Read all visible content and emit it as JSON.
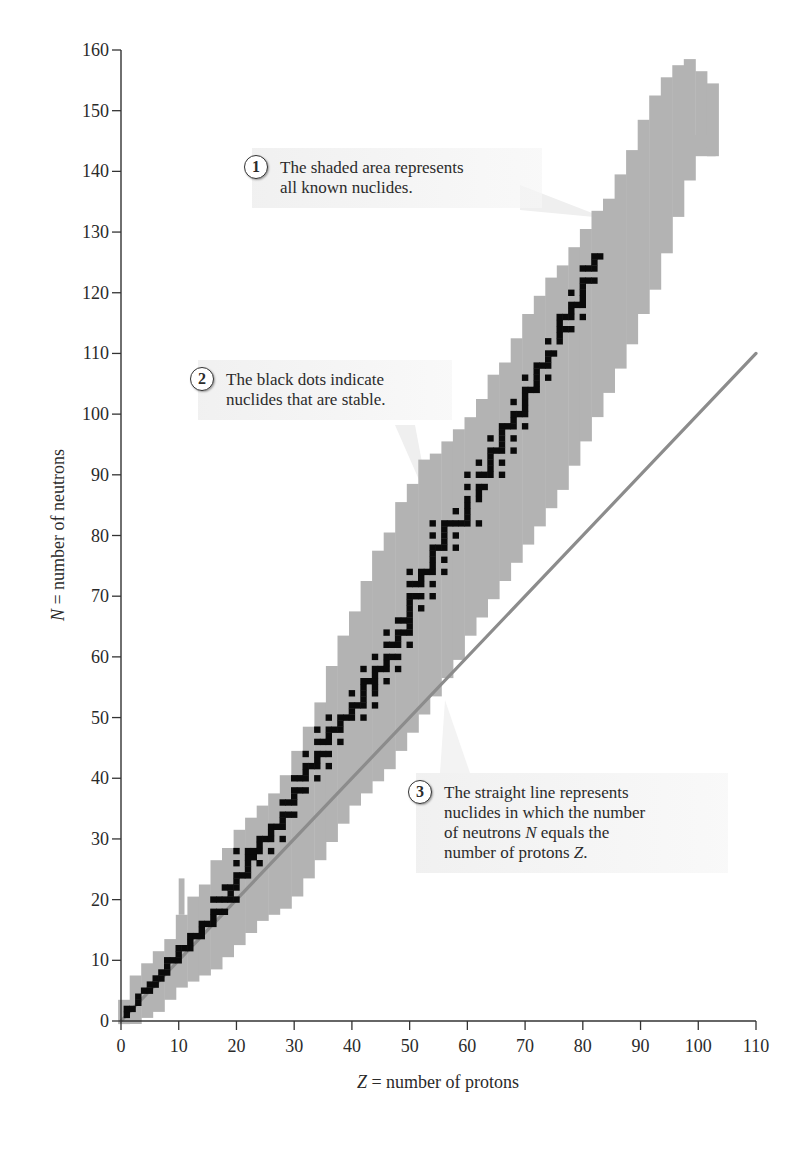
{
  "chart_data": {
    "type": "scatter",
    "xlabel_var": "Z",
    "xlabel_rest": " = number of protons",
    "ylabel_var": "N",
    "ylabel_rest": " = number of neutrons",
    "xlim": [
      0,
      110
    ],
    "ylim": [
      0,
      160
    ],
    "xticks": [
      0,
      10,
      20,
      30,
      40,
      50,
      60,
      70,
      80,
      90,
      100,
      110
    ],
    "yticks": [
      0,
      10,
      20,
      30,
      40,
      50,
      60,
      70,
      80,
      90,
      100,
      110,
      120,
      130,
      140,
      150,
      160
    ],
    "grid": false,
    "legend": "none (annotations used instead)",
    "series": [
      {
        "name": "Known nuclides (shaded area)",
        "kind": "band",
        "color": "#b3b3b3",
        "z": [
          0,
          2,
          4,
          6,
          8,
          10,
          12,
          14,
          16,
          18,
          20,
          22,
          24,
          26,
          28,
          30,
          32,
          34,
          36,
          38,
          40,
          42,
          44,
          46,
          48,
          50,
          52,
          54,
          56,
          58,
          60,
          62,
          64,
          66,
          68,
          70,
          72,
          74,
          76,
          78,
          80,
          82,
          84,
          86,
          88,
          90,
          92,
          94,
          96,
          98,
          100,
          102
        ],
        "n_min": [
          0,
          0,
          1,
          2,
          4,
          6,
          7,
          8,
          9,
          11,
          13,
          15,
          17,
          18,
          19,
          21,
          24,
          27,
          30,
          33,
          36,
          38,
          40,
          42,
          45,
          48,
          51,
          54,
          57,
          60,
          64,
          67,
          70,
          73,
          76,
          79,
          82,
          85,
          88,
          92,
          96,
          100,
          104,
          108,
          112,
          117,
          121,
          127,
          133,
          139,
          144,
          143
        ],
        "n_max": [
          3,
          7,
          9,
          11,
          13,
          17,
          20,
          22,
          26,
          28,
          31,
          33,
          35,
          37,
          40,
          44,
          48,
          52,
          58,
          63,
          67,
          72,
          77,
          80,
          85,
          88,
          92,
          93,
          95,
          97,
          99,
          102,
          106,
          108,
          112,
          116,
          119,
          122,
          124,
          127,
          130,
          133,
          135,
          139,
          143,
          148,
          152,
          155,
          157,
          158,
          156,
          154
        ]
      },
      {
        "name": "Stable nuclides (black dots)",
        "kind": "points",
        "color": "#0a0a0a",
        "points": [
          [
            1,
            1
          ],
          [
            1,
            2
          ],
          [
            2,
            2
          ],
          [
            3,
            3
          ],
          [
            3,
            4
          ],
          [
            4,
            5
          ],
          [
            5,
            5
          ],
          [
            5,
            6
          ],
          [
            6,
            6
          ],
          [
            6,
            7
          ],
          [
            7,
            7
          ],
          [
            7,
            8
          ],
          [
            8,
            8
          ],
          [
            8,
            9
          ],
          [
            8,
            10
          ],
          [
            9,
            10
          ],
          [
            10,
            10
          ],
          [
            10,
            11
          ],
          [
            10,
            12
          ],
          [
            11,
            12
          ],
          [
            12,
            12
          ],
          [
            12,
            13
          ],
          [
            12,
            14
          ],
          [
            13,
            14
          ],
          [
            14,
            14
          ],
          [
            14,
            15
          ],
          [
            14,
            16
          ],
          [
            15,
            16
          ],
          [
            16,
            16
          ],
          [
            16,
            17
          ],
          [
            16,
            18
          ],
          [
            16,
            20
          ],
          [
            17,
            18
          ],
          [
            17,
            20
          ],
          [
            18,
            18
          ],
          [
            18,
            20
          ],
          [
            18,
            22
          ],
          [
            19,
            20
          ],
          [
            19,
            21
          ],
          [
            19,
            22
          ],
          [
            20,
            20
          ],
          [
            20,
            22
          ],
          [
            20,
            23
          ],
          [
            20,
            24
          ],
          [
            20,
            26
          ],
          [
            20,
            28
          ],
          [
            21,
            24
          ],
          [
            22,
            24
          ],
          [
            22,
            25
          ],
          [
            22,
            26
          ],
          [
            22,
            27
          ],
          [
            22,
            28
          ],
          [
            23,
            27
          ],
          [
            23,
            28
          ],
          [
            24,
            26
          ],
          [
            24,
            28
          ],
          [
            24,
            29
          ],
          [
            24,
            30
          ],
          [
            25,
            30
          ],
          [
            26,
            28
          ],
          [
            26,
            30
          ],
          [
            26,
            31
          ],
          [
            26,
            32
          ],
          [
            27,
            32
          ],
          [
            28,
            30
          ],
          [
            28,
            32
          ],
          [
            28,
            33
          ],
          [
            28,
            34
          ],
          [
            28,
            36
          ],
          [
            29,
            34
          ],
          [
            29,
            36
          ],
          [
            30,
            34
          ],
          [
            30,
            36
          ],
          [
            30,
            37
          ],
          [
            30,
            38
          ],
          [
            30,
            40
          ],
          [
            31,
            38
          ],
          [
            31,
            40
          ],
          [
            32,
            38
          ],
          [
            32,
            40
          ],
          [
            32,
            41
          ],
          [
            32,
            42
          ],
          [
            32,
            44
          ],
          [
            33,
            42
          ],
          [
            34,
            40
          ],
          [
            34,
            42
          ],
          [
            34,
            43
          ],
          [
            34,
            44
          ],
          [
            34,
            46
          ],
          [
            34,
            48
          ],
          [
            35,
            44
          ],
          [
            35,
            46
          ],
          [
            36,
            42
          ],
          [
            36,
            44
          ],
          [
            36,
            46
          ],
          [
            36,
            47
          ],
          [
            36,
            48
          ],
          [
            36,
            50
          ],
          [
            37,
            48
          ],
          [
            38,
            46
          ],
          [
            38,
            48
          ],
          [
            38,
            49
          ],
          [
            38,
            50
          ],
          [
            39,
            50
          ],
          [
            40,
            50
          ],
          [
            40,
            51
          ],
          [
            40,
            52
          ],
          [
            40,
            54
          ],
          [
            41,
            52
          ],
          [
            42,
            50
          ],
          [
            42,
            52
          ],
          [
            42,
            53
          ],
          [
            42,
            54
          ],
          [
            42,
            55
          ],
          [
            42,
            56
          ],
          [
            42,
            58
          ],
          [
            43,
            56
          ],
          [
            44,
            52
          ],
          [
            44,
            54
          ],
          [
            44,
            55
          ],
          [
            44,
            56
          ],
          [
            44,
            57
          ],
          [
            44,
            58
          ],
          [
            44,
            60
          ],
          [
            45,
            58
          ],
          [
            46,
            56
          ],
          [
            46,
            58
          ],
          [
            46,
            59
          ],
          [
            46,
            60
          ],
          [
            46,
            62
          ],
          [
            46,
            64
          ],
          [
            47,
            60
          ],
          [
            47,
            62
          ],
          [
            48,
            58
          ],
          [
            48,
            60
          ],
          [
            48,
            62
          ],
          [
            48,
            63
          ],
          [
            48,
            64
          ],
          [
            48,
            66
          ],
          [
            49,
            64
          ],
          [
            49,
            66
          ],
          [
            50,
            62
          ],
          [
            50,
            64
          ],
          [
            50,
            65
          ],
          [
            50,
            66
          ],
          [
            50,
            67
          ],
          [
            50,
            68
          ],
          [
            50,
            69
          ],
          [
            50,
            70
          ],
          [
            50,
            72
          ],
          [
            50,
            74
          ],
          [
            51,
            70
          ],
          [
            51,
            72
          ],
          [
            52,
            68
          ],
          [
            52,
            70
          ],
          [
            52,
            72
          ],
          [
            52,
            73
          ],
          [
            52,
            74
          ],
          [
            53,
            74
          ],
          [
            54,
            70
          ],
          [
            54,
            72
          ],
          [
            54,
            74
          ],
          [
            54,
            75
          ],
          [
            54,
            76
          ],
          [
            54,
            77
          ],
          [
            54,
            78
          ],
          [
            54,
            80
          ],
          [
            54,
            82
          ],
          [
            55,
            78
          ],
          [
            56,
            74
          ],
          [
            56,
            76
          ],
          [
            56,
            78
          ],
          [
            56,
            79
          ],
          [
            56,
            80
          ],
          [
            56,
            81
          ],
          [
            56,
            82
          ],
          [
            57,
            82
          ],
          [
            58,
            78
          ],
          [
            58,
            80
          ],
          [
            58,
            82
          ],
          [
            58,
            84
          ],
          [
            59,
            82
          ],
          [
            60,
            82
          ],
          [
            60,
            83
          ],
          [
            60,
            84
          ],
          [
            60,
            85
          ],
          [
            60,
            86
          ],
          [
            60,
            88
          ],
          [
            60,
            90
          ],
          [
            62,
            82
          ],
          [
            62,
            86
          ],
          [
            62,
            87
          ],
          [
            62,
            88
          ],
          [
            62,
            90
          ],
          [
            62,
            92
          ],
          [
            63,
            88
          ],
          [
            63,
            90
          ],
          [
            64,
            90
          ],
          [
            64,
            91
          ],
          [
            64,
            92
          ],
          [
            64,
            93
          ],
          [
            64,
            94
          ],
          [
            64,
            96
          ],
          [
            65,
            94
          ],
          [
            66,
            90
          ],
          [
            66,
            92
          ],
          [
            66,
            94
          ],
          [
            66,
            95
          ],
          [
            66,
            96
          ],
          [
            66,
            97
          ],
          [
            66,
            98
          ],
          [
            67,
            98
          ],
          [
            68,
            94
          ],
          [
            68,
            96
          ],
          [
            68,
            98
          ],
          [
            68,
            99
          ],
          [
            68,
            100
          ],
          [
            68,
            102
          ],
          [
            69,
            100
          ],
          [
            70,
            98
          ],
          [
            70,
            100
          ],
          [
            70,
            101
          ],
          [
            70,
            102
          ],
          [
            70,
            103
          ],
          [
            70,
            104
          ],
          [
            70,
            106
          ],
          [
            71,
            104
          ],
          [
            72,
            104
          ],
          [
            72,
            105
          ],
          [
            72,
            106
          ],
          [
            72,
            107
          ],
          [
            72,
            108
          ],
          [
            73,
            108
          ],
          [
            74,
            106
          ],
          [
            74,
            108
          ],
          [
            74,
            109
          ],
          [
            74,
            110
          ],
          [
            74,
            112
          ],
          [
            75,
            110
          ],
          [
            76,
            112
          ],
          [
            76,
            113
          ],
          [
            76,
            114
          ],
          [
            76,
            115
          ],
          [
            76,
            116
          ],
          [
            77,
            114
          ],
          [
            77,
            116
          ],
          [
            78,
            114
          ],
          [
            78,
            116
          ],
          [
            78,
            117
          ],
          [
            78,
            118
          ],
          [
            78,
            120
          ],
          [
            79,
            118
          ],
          [
            80,
            116
          ],
          [
            80,
            118
          ],
          [
            80,
            119
          ],
          [
            80,
            120
          ],
          [
            80,
            121
          ],
          [
            80,
            122
          ],
          [
            80,
            124
          ],
          [
            81,
            122
          ],
          [
            81,
            124
          ],
          [
            82,
            122
          ],
          [
            82,
            124
          ],
          [
            82,
            125
          ],
          [
            82,
            126
          ],
          [
            83,
            126
          ]
        ]
      },
      {
        "name": "N = Z line",
        "kind": "line",
        "color": "#8c8c8c",
        "x": [
          0,
          110
        ],
        "y": [
          0,
          110
        ]
      }
    ],
    "annotations": [
      {
        "id": 1,
        "text": "The shaded area represents all known nuclides."
      },
      {
        "id": 2,
        "text": "The black dots indicate nuclides that are stable."
      },
      {
        "id": 3,
        "text": "The straight line represents nuclides in which the number of neutrons N equals the number of protons Z."
      }
    ]
  },
  "callouts": {
    "c1": {
      "num": "1",
      "line1": "The shaded area represents",
      "line2": "all known nuclides."
    },
    "c2": {
      "num": "2",
      "line1": "The black dots indicate",
      "line2": "nuclides that are stable."
    },
    "c3": {
      "num": "3",
      "line1": "The straight line represents",
      "line2": "nuclides in which the number",
      "line3a": "of neutrons ",
      "line3var": "N",
      "line3b": " equals the",
      "line4a": "number of protons ",
      "line4var": "Z",
      "line4b": "."
    }
  },
  "colors": {
    "band": "#b3b3b3",
    "stable": "#0a0a0a",
    "diagonal": "#8c8c8c",
    "axis": "#333333",
    "text": "#2a2a2a"
  }
}
